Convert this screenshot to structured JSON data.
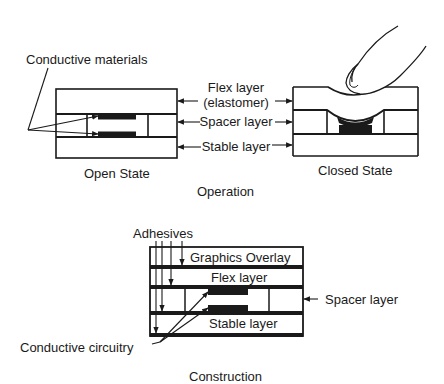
{
  "operation": {
    "caption": "Operation",
    "labels": {
      "conductive_materials": "Conductive materials",
      "flex_layer_line1": "Flex layer",
      "flex_layer_line2": "(elastomer)",
      "spacer_layer": "Spacer layer",
      "stable_layer": "Stable layer"
    },
    "open_state": {
      "caption": "Open State"
    },
    "closed_state": {
      "caption": "Closed State"
    }
  },
  "construction": {
    "caption": "Construction",
    "labels": {
      "adhesives": "Adhesives",
      "graphics_overlay": "Graphics Overlay",
      "flex_layer": "Flex layer",
      "spacer_layer": "Spacer layer",
      "stable_layer": "Stable layer",
      "conductive_circuitry": "Conductive circuitry"
    }
  },
  "colors": {
    "ink": "#1a1a1a",
    "background": "#ffffff"
  }
}
